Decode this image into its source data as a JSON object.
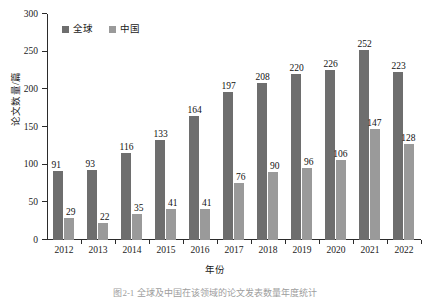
{
  "figure": {
    "caption_partial": "图2-1  全球及中国在该领域的论文发表数量年度统计",
    "xtitle": "年份",
    "ylabel": "论文数量/篇"
  },
  "legend": {
    "position": "top-left-inside",
    "items": [
      {
        "label": "全球",
        "color": "#6e6e6e",
        "marker": "square-swatch"
      },
      {
        "label": "中国",
        "color": "#9a9a9a",
        "marker": "square-swatch"
      }
    ]
  },
  "chart_data": {
    "type": "bar",
    "title": "",
    "subtitle": "",
    "xlabel": "年份",
    "ylabel": "论文数量/篇",
    "grid": false,
    "legend_position": "top-left",
    "categories": [
      "2012",
      "2013",
      "2014",
      "2015",
      "2016",
      "2017",
      "2018",
      "2019",
      "2020",
      "2021",
      "2022"
    ],
    "yticks": [
      0,
      50,
      100,
      150,
      200,
      250,
      300
    ],
    "ylim": [
      0,
      300
    ],
    "series": [
      {
        "name": "全球",
        "color": "#6e6e6e",
        "values": [
          91,
          93,
          116,
          133,
          164,
          197,
          208,
          220,
          226,
          252,
          223
        ]
      },
      {
        "name": "中国",
        "color": "#9a9a9a",
        "values": [
          29,
          22,
          35,
          41,
          41,
          76,
          90,
          96,
          106,
          147,
          128
        ]
      }
    ]
  }
}
